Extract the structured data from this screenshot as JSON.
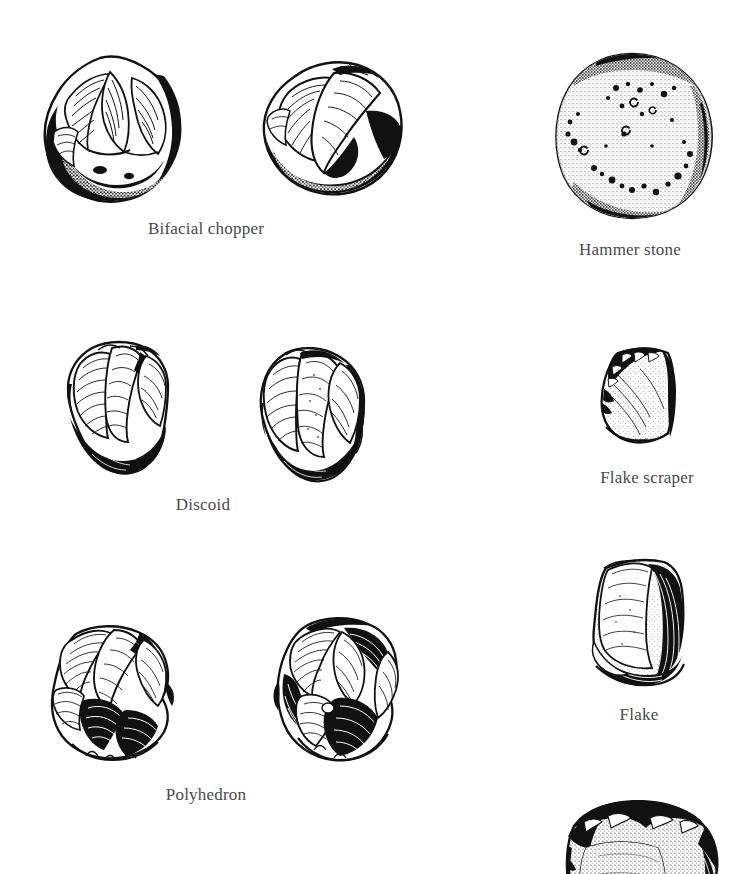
{
  "plate": {
    "title": "Oldowan stone tool types",
    "background_color": "#ffffff",
    "ink_color": "#111111",
    "caption_color": "#4a4a4a",
    "width": 756,
    "height": 874
  },
  "figures": [
    {
      "id": "bifacial-chopper",
      "label": "Bifacial chopper",
      "views": 2,
      "view_names": [
        "bifacial-chopper-view-a",
        "bifacial-chopper-view-b"
      ],
      "caption_x": 206,
      "caption_y": 219,
      "row": 1,
      "column": "left"
    },
    {
      "id": "hammer-stone",
      "label": "Hammer stone",
      "views": 1,
      "view_names": [
        "hammer-stone-view-a"
      ],
      "caption_x": 630,
      "caption_y": 240,
      "row": 1,
      "column": "right"
    },
    {
      "id": "discoid",
      "label": "Discoid",
      "views": 2,
      "view_names": [
        "discoid-view-a",
        "discoid-view-b"
      ],
      "caption_x": 203,
      "caption_y": 505,
      "row": 2,
      "column": "left"
    },
    {
      "id": "flake-scraper",
      "label": "Flake scraper",
      "views": 1,
      "view_names": [
        "flake-scraper-view-a"
      ],
      "caption_x": 647,
      "caption_y": 478,
      "row": 2,
      "column": "right"
    },
    {
      "id": "polyhedron",
      "label": "Polyhedron",
      "views": 2,
      "view_names": [
        "polyhedron-view-a",
        "polyhedron-view-b"
      ],
      "caption_x": 206,
      "caption_y": 795,
      "row": 3,
      "column": "left"
    },
    {
      "id": "flake",
      "label": "Flake",
      "views": 1,
      "view_names": [
        "flake-view-a"
      ],
      "caption_x": 639,
      "caption_y": 715,
      "row": 3,
      "column": "right"
    },
    {
      "id": "cropped-tool",
      "label": "",
      "views": 1,
      "view_names": [
        "cropped-tool-view-a"
      ],
      "caption_x": 0,
      "caption_y": 0,
      "row": 4,
      "column": "right"
    }
  ]
}
